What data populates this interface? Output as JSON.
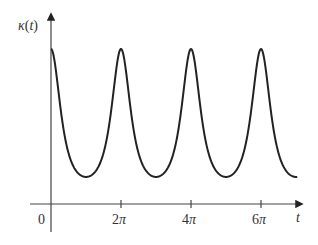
{
  "chart_data": {
    "type": "line",
    "title": "",
    "xlabel": "t",
    "ylabel": "κ(t)",
    "x_ticks": [
      {
        "value": 0,
        "label": "0"
      },
      {
        "value": 6.2832,
        "label": "2π"
      },
      {
        "value": 12.5664,
        "label": "4π"
      },
      {
        "value": 18.8496,
        "label": "6π"
      }
    ],
    "y_ticks": [],
    "xlim": [
      0,
      22.1
    ],
    "grid": false,
    "legend": null,
    "series": [
      {
        "name": "κ(t)",
        "description": "Periodic curvature with period 2π, sharp peaks at t = 0, 2π, 4π, 6π and broad minima at t = π, 3π, 5π, 7π",
        "formula_approx": "κ(t) = 1 / (1 + 1.1(1 − cos t))^1.5",
        "x": [
          0,
          1.5708,
          3.1416,
          4.7124,
          6.2832,
          7.854,
          9.4248,
          10.9956,
          12.5664,
          14.1372,
          15.708,
          17.2788,
          18.8496,
          20.4204,
          21.9911
        ],
        "values": [
          1.0,
          0.42,
          0.175,
          0.42,
          1.0,
          0.42,
          0.175,
          0.42,
          1.0,
          0.42,
          0.175,
          0.42,
          1.0,
          0.42,
          0.175
        ]
      }
    ],
    "peaks_at": [
      "0",
      "2π",
      "4π",
      "6π"
    ],
    "colors": {
      "curve": "#222222",
      "axes": "#444444",
      "text": "#333333"
    }
  },
  "axes": {
    "y_label": "κ(t)",
    "x_label": "t",
    "origin_label": "0",
    "tick_labels": [
      "2π",
      "4π",
      "6π"
    ]
  }
}
